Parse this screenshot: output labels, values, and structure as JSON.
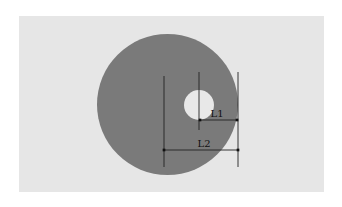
{
  "diagram": {
    "title": "",
    "colors": {
      "page_background": "#ffffff",
      "panel_background": "#e6e6e6",
      "disc_fill": "#7a7a7a",
      "hole_fill": "#e8e8e8",
      "line_color": "#222222",
      "label_color": "#111111"
    },
    "panel": {
      "x": 19,
      "y": 16,
      "width": 305,
      "height": 176
    },
    "disc": {
      "cx": 167.5,
      "cy": 104.5,
      "r": 70.5
    },
    "hole": {
      "cx": 199,
      "cy": 105,
      "r": 15
    },
    "extension_lines": [
      {
        "name": "disc-center-line",
        "x": 164,
        "y1": 76,
        "y2": 167
      },
      {
        "name": "hole-center-line",
        "x": 199,
        "y1": 72,
        "y2": 130
      },
      {
        "name": "disc-edge-line",
        "x": 238,
        "y1": 72,
        "y2": 167
      }
    ],
    "dimensions": [
      {
        "name": "L1",
        "label": "L1",
        "x1": 200,
        "x2": 237,
        "y": 120,
        "label_x": 217,
        "label_y": 117
      },
      {
        "name": "L2",
        "label": "L2",
        "x1": 164,
        "x2": 238,
        "y": 150,
        "label_x": 204,
        "label_y": 147
      }
    ]
  }
}
